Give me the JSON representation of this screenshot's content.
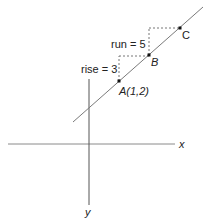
{
  "diagram": {
    "axes": {
      "x_label": "x",
      "y_label": "y"
    },
    "points": [
      {
        "id": "A",
        "label": "A(1,2)",
        "x": 119,
        "y": 81
      },
      {
        "id": "B",
        "label": "B",
        "x": 149,
        "y": 55
      },
      {
        "id": "C",
        "label": "C",
        "x": 180,
        "y": 28
      }
    ],
    "annotations": {
      "rise": "rise = 3",
      "run": "run = 5"
    },
    "colors": {
      "line": "#777777",
      "axis": "#555555",
      "dashed": "#777777",
      "point": "#111111",
      "text": "#222222"
    }
  }
}
